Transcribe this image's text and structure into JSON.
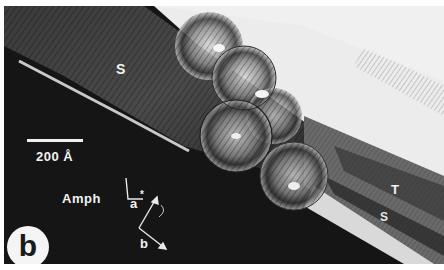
{
  "figure": {
    "panel_label": "b",
    "scale_bar": {
      "label": "200 Å"
    },
    "labels": {
      "upper_phase": "S",
      "right_upper_phase": "T",
      "right_lower_phase": "S",
      "host": "Amph"
    },
    "axes": {
      "a_axis": "a",
      "a_star_marker": "*",
      "b_axis": "b"
    },
    "colors": {
      "background_dark": "#1a1a1a",
      "background_light": "#ededed",
      "label_text": "#f2f2f2",
      "border": "#ffffff"
    }
  }
}
